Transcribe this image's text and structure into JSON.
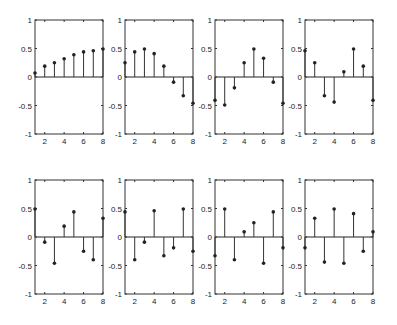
{
  "figure": {
    "width": 397,
    "height": 325,
    "rows": 2,
    "cols": 4
  },
  "chart_data": [
    {
      "type": "stem",
      "title": "",
      "xlabel": "",
      "ylabel": "",
      "x": [
        1,
        2,
        3,
        4,
        5,
        6,
        7,
        8
      ],
      "values": [
        0.07,
        0.19,
        0.25,
        0.32,
        0.39,
        0.44,
        0.46,
        0.49
      ],
      "xlim": [
        1,
        8
      ],
      "ylim": [
        -1,
        1
      ],
      "xticks": [
        2,
        4,
        6,
        8
      ],
      "yticks": [
        -1,
        -0.5,
        0,
        0.5,
        1
      ],
      "grid": false
    },
    {
      "type": "stem",
      "title": "",
      "xlabel": "",
      "ylabel": "",
      "x": [
        1,
        2,
        3,
        4,
        5,
        6,
        7,
        8
      ],
      "values": [
        0.25,
        0.44,
        0.49,
        0.41,
        0.19,
        -0.09,
        -0.33,
        -0.46
      ],
      "xlim": [
        1,
        8
      ],
      "ylim": [
        -1,
        1
      ],
      "xticks": [
        2,
        4,
        6,
        8
      ],
      "yticks": [
        -1,
        -0.5,
        0,
        0.5,
        1
      ],
      "grid": false
    },
    {
      "type": "stem",
      "title": "",
      "xlabel": "",
      "ylabel": "",
      "x": [
        1,
        2,
        3,
        4,
        5,
        6,
        7,
        8
      ],
      "values": [
        -0.41,
        -0.49,
        -0.19,
        0.25,
        0.49,
        0.33,
        -0.09,
        -0.46
      ],
      "xlim": [
        1,
        8
      ],
      "ylim": [
        -1,
        1
      ],
      "xticks": [
        2,
        4,
        6,
        8
      ],
      "yticks": [
        -1,
        -0.5,
        0,
        0.5,
        1
      ],
      "grid": false
    },
    {
      "type": "stem",
      "title": "",
      "xlabel": "",
      "ylabel": "",
      "x": [
        1,
        2,
        3,
        4,
        5,
        6,
        7,
        8
      ],
      "values": [
        0.46,
        0.25,
        -0.33,
        -0.44,
        0.09,
        0.49,
        0.19,
        -0.41
      ],
      "xlim": [
        1,
        8
      ],
      "ylim": [
        -1,
        1
      ],
      "xticks": [
        2,
        4,
        6,
        8
      ],
      "yticks": [
        -1,
        -0.5,
        0,
        0.5,
        1
      ],
      "grid": false
    },
    {
      "type": "stem",
      "title": "",
      "xlabel": "",
      "ylabel": "",
      "x": [
        1,
        2,
        3,
        4,
        5,
        6,
        7,
        8
      ],
      "values": [
        0.49,
        -0.09,
        -0.46,
        0.19,
        0.44,
        -0.25,
        -0.4,
        0.33
      ],
      "xlim": [
        1,
        8
      ],
      "ylim": [
        -1,
        1
      ],
      "xticks": [
        2,
        4,
        6,
        8
      ],
      "yticks": [
        -1,
        -0.5,
        0,
        0.5,
        1
      ],
      "grid": false
    },
    {
      "type": "stem",
      "title": "",
      "xlabel": "",
      "ylabel": "",
      "x": [
        1,
        2,
        3,
        4,
        5,
        6,
        7,
        8
      ],
      "values": [
        0.44,
        -0.4,
        -0.09,
        0.46,
        -0.33,
        -0.19,
        0.49,
        -0.25
      ],
      "xlim": [
        1,
        8
      ],
      "ylim": [
        -1,
        1
      ],
      "xticks": [
        2,
        4,
        6,
        8
      ],
      "yticks": [
        -1,
        -0.5,
        0,
        0.5,
        1
      ],
      "grid": false
    },
    {
      "type": "stem",
      "title": "",
      "xlabel": "",
      "ylabel": "",
      "x": [
        1,
        2,
        3,
        4,
        5,
        6,
        7,
        8
      ],
      "values": [
        -0.33,
        0.49,
        -0.4,
        0.09,
        0.25,
        -0.46,
        0.44,
        -0.19
      ],
      "xlim": [
        1,
        8
      ],
      "ylim": [
        -1,
        1
      ],
      "xticks": [
        2,
        4,
        6,
        8
      ],
      "yticks": [
        -1,
        -0.5,
        0,
        0.5,
        1
      ],
      "grid": false
    },
    {
      "type": "stem",
      "title": "",
      "xlabel": "",
      "ylabel": "",
      "x": [
        1,
        2,
        3,
        4,
        5,
        6,
        7,
        8
      ],
      "values": [
        -0.19,
        0.33,
        -0.44,
        0.49,
        -0.46,
        0.41,
        -0.25,
        0.09
      ],
      "xlim": [
        1,
        8
      ],
      "ylim": [
        -1,
        1
      ],
      "xticks": [
        2,
        4,
        6,
        8
      ],
      "yticks": [
        -1,
        -0.5,
        0,
        0.5,
        1
      ],
      "grid": false
    }
  ],
  "layout": {
    "col_left": [
      35,
      125,
      215,
      305
    ],
    "axis_width": 68,
    "row_top": [
      20,
      180
    ],
    "axis_height": 114
  },
  "tick_labels": {
    "y": [
      "1",
      "0.5",
      "0",
      "-0.5",
      "-1"
    ],
    "x": [
      "2",
      "4",
      "6",
      "8"
    ]
  }
}
